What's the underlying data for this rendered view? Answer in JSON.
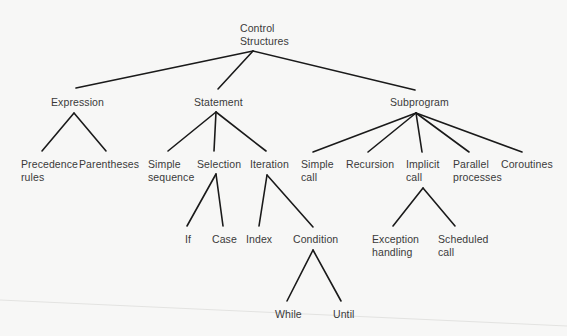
{
  "diagram": {
    "type": "tree",
    "title": "Control Structures",
    "nodes": {
      "root": {
        "label": "Control\nStructures",
        "x": 240,
        "y": 22
      },
      "expression": {
        "label": "Expression",
        "x": 51,
        "y": 96
      },
      "statement": {
        "label": "Statement",
        "x": 194,
        "y": 96
      },
      "subprogram": {
        "label": "Subprogram",
        "x": 390,
        "y": 96
      },
      "precedence_rules": {
        "label": "Precedence\nrules",
        "x": 21,
        "y": 158
      },
      "parentheses": {
        "label": "Parentheses",
        "x": 79,
        "y": 158
      },
      "simple_sequence": {
        "label": "Simple\nsequence",
        "x": 148,
        "y": 158
      },
      "selection": {
        "label": "Selection",
        "x": 197,
        "y": 158
      },
      "iteration": {
        "label": "Iteration",
        "x": 250,
        "y": 158
      },
      "simple_call": {
        "label": "Simple\ncall",
        "x": 301,
        "y": 158
      },
      "recursion": {
        "label": "Recursion",
        "x": 346,
        "y": 158
      },
      "implicit_call": {
        "label": "Implicit\ncall",
        "x": 406,
        "y": 158
      },
      "parallel_processes": {
        "label": "Parallel\nprocesses",
        "x": 453,
        "y": 158
      },
      "coroutines": {
        "label": "Coroutines",
        "x": 501,
        "y": 158
      },
      "if": {
        "label": "If",
        "x": 185,
        "y": 233
      },
      "case": {
        "label": "Case",
        "x": 212,
        "y": 233
      },
      "index": {
        "label": "Index",
        "x": 246,
        "y": 233
      },
      "condition": {
        "label": "Condition",
        "x": 293,
        "y": 233
      },
      "exception_handling": {
        "label": "Exception\nhandling",
        "x": 372,
        "y": 233
      },
      "scheduled_call": {
        "label": "Scheduled\ncall",
        "x": 438,
        "y": 233
      },
      "while": {
        "label": "While",
        "x": 275,
        "y": 308
      },
      "until": {
        "label": "Until",
        "x": 333,
        "y": 308
      }
    },
    "edges": [
      {
        "from": "root",
        "to": "expression",
        "x1": 253,
        "y1": 51,
        "x2": 76,
        "y2": 88
      },
      {
        "from": "root",
        "to": "statement",
        "x1": 253,
        "y1": 51,
        "x2": 218,
        "y2": 89
      },
      {
        "from": "root",
        "to": "subprogram",
        "x1": 253,
        "y1": 51,
        "x2": 415,
        "y2": 90
      },
      {
        "from": "expression",
        "to": "precedence_rules",
        "x1": 74,
        "y1": 113,
        "x2": 42,
        "y2": 151
      },
      {
        "from": "expression",
        "to": "parentheses",
        "x1": 74,
        "y1": 113,
        "x2": 106,
        "y2": 151
      },
      {
        "from": "statement",
        "to": "simple_sequence",
        "x1": 216,
        "y1": 112,
        "x2": 168,
        "y2": 151
      },
      {
        "from": "statement",
        "to": "selection",
        "x1": 216,
        "y1": 112,
        "x2": 214,
        "y2": 151
      },
      {
        "from": "statement",
        "to": "iteration",
        "x1": 216,
        "y1": 112,
        "x2": 266,
        "y2": 151
      },
      {
        "from": "subprogram",
        "to": "simple_call",
        "x1": 416,
        "y1": 113,
        "x2": 313,
        "y2": 152
      },
      {
        "from": "subprogram",
        "to": "recursion",
        "x1": 416,
        "y1": 113,
        "x2": 368,
        "y2": 152
      },
      {
        "from": "subprogram",
        "to": "implicit_call",
        "x1": 416,
        "y1": 113,
        "x2": 422,
        "y2": 152
      },
      {
        "from": "subprogram",
        "to": "parallel_processes",
        "x1": 416,
        "y1": 113,
        "x2": 469,
        "y2": 152
      },
      {
        "from": "subprogram",
        "to": "coroutines",
        "x1": 416,
        "y1": 113,
        "x2": 522,
        "y2": 152
      },
      {
        "from": "selection",
        "to": "if",
        "x1": 216,
        "y1": 174,
        "x2": 187,
        "y2": 226
      },
      {
        "from": "selection",
        "to": "case",
        "x1": 216,
        "y1": 174,
        "x2": 223,
        "y2": 226
      },
      {
        "from": "iteration",
        "to": "index",
        "x1": 267,
        "y1": 175,
        "x2": 259,
        "y2": 226
      },
      {
        "from": "iteration",
        "to": "condition",
        "x1": 267,
        "y1": 175,
        "x2": 313,
        "y2": 227
      },
      {
        "from": "implicit_call",
        "to": "exception_handling",
        "x1": 423,
        "y1": 188,
        "x2": 393,
        "y2": 226
      },
      {
        "from": "implicit_call",
        "to": "scheduled_call",
        "x1": 423,
        "y1": 188,
        "x2": 455,
        "y2": 226
      },
      {
        "from": "condition",
        "to": "while",
        "x1": 313,
        "y1": 250,
        "x2": 287,
        "y2": 301
      },
      {
        "from": "condition",
        "to": "until",
        "x1": 313,
        "y1": 250,
        "x2": 341,
        "y2": 301
      }
    ],
    "colors": {
      "background": "#f7f7f6",
      "line": "#1a1a1a",
      "text": "#3a3a3a"
    }
  }
}
